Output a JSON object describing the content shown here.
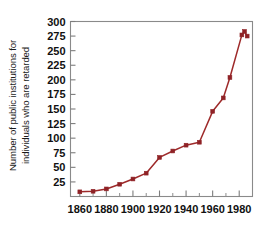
{
  "chart_data": {
    "type": "line",
    "title": "",
    "subtitle": "",
    "xlabel": "",
    "ylabel": "Number of public institutions for individuals who are retarded",
    "ylabel_lines": [
      "Number of public institutions for",
      "individuals who are retarded"
    ],
    "xlim": [
      1853,
      1990
    ],
    "ylim": [
      0,
      300
    ],
    "yticks": [
      25,
      50,
      75,
      100,
      125,
      150,
      175,
      200,
      225,
      250,
      275,
      300
    ],
    "ytick_labels": [
      "25",
      "50",
      "75",
      "100",
      "125",
      "150",
      "175",
      "200",
      "225",
      "250",
      "275",
      "300"
    ],
    "xticks": [
      1860,
      1880,
      1900,
      1920,
      1940,
      1960,
      1980
    ],
    "xtick_labels": [
      "1860",
      "1880",
      "1900",
      "1920",
      "1940",
      "1960",
      "1980"
    ],
    "x_minor_ticks": [
      1870,
      1890,
      1910,
      1930,
      1950,
      1970
    ],
    "grid": false,
    "legend": false,
    "legend_position": "none",
    "markers": "square",
    "line_color": "#9e2a2a",
    "marker_color": "#8f2226",
    "frame_color": "#8a8a8a",
    "series": [
      {
        "name": "Public institutions",
        "x": [
          1860,
          1870,
          1880,
          1890,
          1900,
          1910,
          1920,
          1930,
          1940,
          1950,
          1960,
          1968,
          1973,
          1982,
          1984,
          1986
        ],
        "values": [
          8,
          9,
          13,
          21,
          30,
          40,
          67,
          78,
          88,
          93,
          146,
          169,
          204,
          277,
          283,
          275
        ]
      }
    ]
  }
}
